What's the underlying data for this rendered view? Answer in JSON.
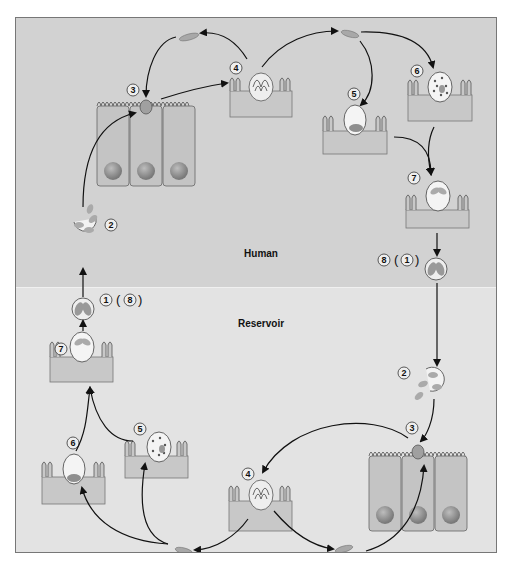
{
  "diagram": {
    "zones": {
      "human": "Human",
      "reservoir": "Reservoir"
    },
    "colors": {
      "human_bg": "#d2d2d2",
      "reservoir_bg": "#e3e3e3",
      "cell_fill": "#c9c9c9",
      "nucleus": "#8f8f8f",
      "parasite": "#a8a8a8",
      "arrow": "#111111"
    },
    "human_cycle": {
      "stages": [
        {
          "num": "1",
          "secondary": "8",
          "desc": "oocyst (sporulated) ingested"
        },
        {
          "num": "2",
          "desc": "sporozoites excyst"
        },
        {
          "num": "3",
          "desc": "sporozoite invades epithelial cell"
        },
        {
          "num": "4",
          "desc": "meront with merozoites"
        },
        {
          "num": "5",
          "desc": "macrogamont"
        },
        {
          "num": "6",
          "desc": "microgamont"
        },
        {
          "num": "7",
          "desc": "oocyst"
        },
        {
          "num": "8",
          "secondary": "1",
          "desc": "oocyst shed"
        }
      ]
    },
    "reservoir_cycle": {
      "stages": [
        {
          "num": "1",
          "secondary": "8"
        },
        {
          "num": "2"
        },
        {
          "num": "3"
        },
        {
          "num": "4"
        },
        {
          "num": "5"
        },
        {
          "num": "6"
        },
        {
          "num": "7"
        }
      ]
    },
    "labels": {
      "h1": "1",
      "h1b": "8",
      "h2": "2",
      "h3": "3",
      "h4": "4",
      "h5": "5",
      "h6": "6",
      "h7": "7",
      "h8": "8",
      "h8b": "1",
      "r2": "2",
      "r3": "3",
      "r4": "4",
      "r5": "5",
      "r6": "6",
      "r7": "7"
    }
  }
}
